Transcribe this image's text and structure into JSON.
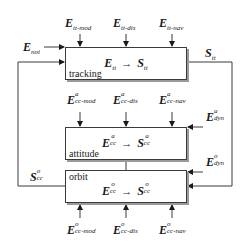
{
  "diagram": {
    "colors": {
      "line": "#3a3a3a",
      "shadow": "#9a9a9a",
      "text": "#1a1a1a"
    },
    "blocks": {
      "tracking": {
        "label": "tracking",
        "input": {
          "base": "E",
          "sub": "tt",
          "sup": ""
        },
        "output": {
          "base": "S",
          "sub": "tt",
          "sup": ""
        },
        "arrow": "→"
      },
      "attitude": {
        "label": "attitude",
        "input": {
          "base": "E",
          "sub": "cc",
          "sup": "a"
        },
        "output": {
          "base": "S",
          "sub": "cc",
          "sup": "a"
        },
        "arrow": "→"
      },
      "orbit": {
        "label": "orbit",
        "input": {
          "base": "E",
          "sub": "cc",
          "sup": "o"
        },
        "output": {
          "base": "S",
          "sub": "cc",
          "sup": "o"
        },
        "arrow": "→"
      }
    },
    "inputs": {
      "tracking": [
        {
          "base": "E",
          "sub": "tt-mod",
          "sup": ""
        },
        {
          "base": "E",
          "sub": "tt-dis",
          "sup": ""
        },
        {
          "base": "E",
          "sub": "tt-nav",
          "sup": ""
        }
      ],
      "attitude": [
        {
          "base": "E",
          "sub": "cc-mod",
          "sup": "a"
        },
        {
          "base": "E",
          "sub": "cc-dis",
          "sup": "a"
        },
        {
          "base": "E",
          "sub": "cc-nav",
          "sup": "a"
        }
      ],
      "orbit": [
        {
          "base": "E",
          "sub": "cc-mod",
          "sup": "o"
        },
        {
          "base": "E",
          "sub": "cc-dis",
          "sup": "o"
        },
        {
          "base": "E",
          "sub": "cc-nav",
          "sup": "o"
        }
      ]
    },
    "side_signals": {
      "noise": {
        "base": "E",
        "sub": "noi",
        "sup": ""
      },
      "tracking_output": {
        "base": "S",
        "sub": "tt",
        "sup": ""
      },
      "attitude_dyn": {
        "base": "E",
        "sub": "dyn",
        "sup": "a"
      },
      "orbit_dyn": {
        "base": "E",
        "sub": "dyn",
        "sup": "o"
      },
      "orbit_feedback": {
        "base": "S",
        "sub": "cc",
        "sup": "o"
      }
    }
  }
}
